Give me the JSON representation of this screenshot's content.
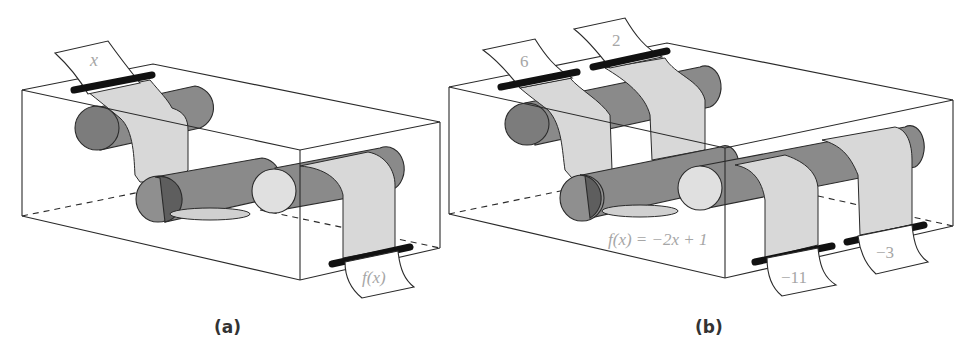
{
  "panels": [
    {
      "id": "a",
      "caption": "(a)",
      "input_label": "x",
      "output_label": "f(x)"
    },
    {
      "id": "b",
      "caption": "(b)",
      "inputs": [
        "6",
        "2"
      ],
      "outputs": [
        "−11",
        "−3"
      ],
      "function_label": "f(x) = −2x + 1"
    }
  ],
  "colors": {
    "cylinder": "#8a8a8a",
    "paper": "#d8d8d8",
    "text": "#a6a6a6",
    "outline": "#2a2a2a"
  }
}
